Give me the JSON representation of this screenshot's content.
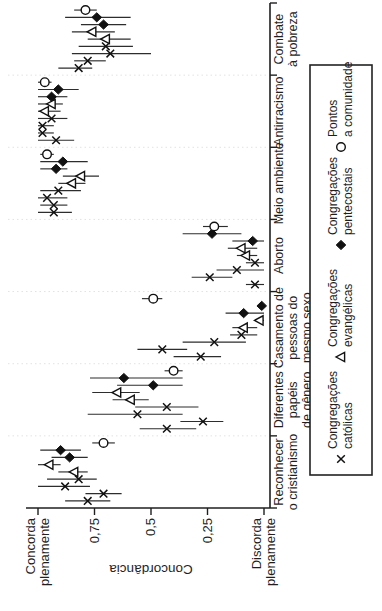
{
  "figure": {
    "background": "#ffffff",
    "ink": "#1f1f1f",
    "marker_color": "#111111",
    "errorbar_color": "#2d2d2d",
    "separator_color": "#e2e2e2"
  },
  "chart_data": {
    "type": "scatter",
    "title": "",
    "ylabel": "Concordância",
    "ylim": [
      0,
      1
    ],
    "grid": "dotted vertical separators between categories",
    "layout": {
      "rotated_90_ccw": true,
      "legend_position": "bottom"
    },
    "yticks": [
      {
        "value": 1.0,
        "lines": [
          "Concorda",
          "plenamente"
        ]
      },
      {
        "value": 0.75,
        "lines": [
          "0,75"
        ]
      },
      {
        "value": 0.5,
        "lines": [
          "0,5"
        ]
      },
      {
        "value": 0.25,
        "lines": [
          "0,25"
        ]
      },
      {
        "value": 0.0,
        "lines": [
          "Discorda",
          "plenamente"
        ]
      }
    ],
    "legend": [
      {
        "series": "congregacoes-catolicas",
        "marker": "x",
        "lines": [
          "Congregações",
          "católicas"
        ]
      },
      {
        "series": "congregacoes-evangelicas",
        "marker": "triangle-open",
        "lines": [
          "Congregações",
          "evangélicas"
        ]
      },
      {
        "series": "congregacoes-pentecostais",
        "marker": "diamond-filled",
        "lines": [
          "Congregações",
          "pentecostais"
        ]
      },
      {
        "series": "pontos-a-comunidade",
        "marker": "circle-open",
        "lines": [
          "Pontos",
          "a comunidade"
        ]
      }
    ],
    "point_format": [
      "marker",
      "value",
      "ci_low",
      "ci_high"
    ],
    "categories": [
      {
        "name": "Reconhecer o cristianismo",
        "lines": [
          "Reconhecer",
          "o cristianismo"
        ],
        "points": [
          [
            "x",
            0.78,
            0.68,
            0.88
          ],
          [
            "x",
            0.71,
            0.63,
            0.79
          ],
          [
            "x",
            0.88,
            0.77,
            1.0
          ],
          [
            "x",
            0.82,
            0.74,
            0.96
          ],
          [
            "triangle-open",
            0.84,
            0.78,
            0.91
          ],
          [
            "triangle-open",
            0.95,
            0.9,
            1.0
          ],
          [
            "diamond-filled",
            0.86,
            0.78,
            0.94
          ],
          [
            "diamond-filled",
            0.9,
            0.81,
            0.99
          ],
          [
            "circle-open",
            0.71,
            0.66,
            0.76
          ]
        ]
      },
      {
        "name": "Diferentes papéis de gênero",
        "lines": [
          "Diferentes",
          "papéis",
          "de gênero"
        ],
        "points": [
          [
            "x",
            0.43,
            0.3,
            0.55
          ],
          [
            "x",
            0.27,
            0.18,
            0.37
          ],
          [
            "x",
            0.56,
            0.36,
            0.78
          ],
          [
            "x",
            0.43,
            0.29,
            0.57
          ],
          [
            "triangle-open",
            0.59,
            0.51,
            0.67
          ],
          [
            "triangle-open",
            0.65,
            0.55,
            0.76
          ],
          [
            "diamond-filled",
            0.49,
            0.36,
            0.65
          ],
          [
            "diamond-filled",
            0.62,
            0.36,
            0.77
          ],
          [
            "circle-open",
            0.4,
            0.36,
            0.44
          ]
        ]
      },
      {
        "name": "Casamento de pessoas do mesmo sexo",
        "lines": [
          "Casamento de",
          "pessoas do",
          "mesmo sexo"
        ],
        "points": [
          [
            "x",
            0.28,
            0.19,
            0.4
          ],
          [
            "x",
            0.45,
            0.34,
            0.56
          ],
          [
            "x",
            0.22,
            0.08,
            0.36
          ],
          [
            "x",
            0.1,
            0.03,
            0.15
          ],
          [
            "triangle-open",
            0.09,
            0.03,
            0.14
          ],
          [
            "triangle-open",
            0.02,
            0.0,
            0.04
          ],
          [
            "diamond-filled",
            0.09,
            0.0,
            0.17
          ],
          [
            "diamond-filled",
            0.01,
            0.0,
            0.03
          ],
          [
            "circle-open",
            0.49,
            0.45,
            0.54
          ]
        ]
      },
      {
        "name": "Aborto",
        "lines": [
          "Aborto"
        ],
        "points": [
          [
            "x",
            0.04,
            0.0,
            0.08
          ],
          [
            "x",
            0.24,
            0.14,
            0.32
          ],
          [
            "x",
            0.12,
            0.0,
            0.21
          ],
          [
            "x",
            0.04,
            0.0,
            0.08
          ],
          [
            "triangle-open",
            0.08,
            0.03,
            0.12
          ],
          [
            "triangle-open",
            0.1,
            0.03,
            0.16
          ],
          [
            "diamond-filled",
            0.05,
            0.0,
            0.14
          ],
          [
            "diamond-filled",
            0.23,
            0.1,
            0.36
          ],
          [
            "circle-open",
            0.22,
            0.16,
            0.27
          ]
        ]
      },
      {
        "name": "Meio ambiente",
        "lines": [
          "Meio ambiente"
        ],
        "points": [
          [
            "x",
            0.93,
            0.85,
            1.0
          ],
          [
            "x",
            0.93,
            0.87,
            0.99
          ],
          [
            "x",
            0.96,
            0.87,
            1.0
          ],
          [
            "x",
            0.91,
            0.81,
            0.99
          ],
          [
            "triangle-open",
            0.85,
            0.79,
            0.91
          ],
          [
            "triangle-open",
            0.81,
            0.73,
            0.89
          ],
          [
            "diamond-filled",
            0.92,
            0.87,
            0.99
          ],
          [
            "diamond-filled",
            0.89,
            0.78,
            0.99
          ],
          [
            "circle-open",
            0.96,
            0.93,
            0.99
          ]
        ]
      },
      {
        "name": "Antirracismo",
        "lines": [
          "Antirracismo"
        ],
        "points": [
          [
            "x",
            0.92,
            0.84,
            1.0
          ],
          [
            "x",
            0.98,
            0.93,
            1.0
          ],
          [
            "x",
            0.98,
            0.93,
            1.0
          ],
          [
            "x",
            0.94,
            0.87,
            1.0
          ],
          [
            "triangle-open",
            0.97,
            0.9,
            1.0
          ],
          [
            "triangle-open",
            0.94,
            0.89,
            1.0
          ],
          [
            "diamond-filled",
            0.94,
            0.87,
            1.0
          ],
          [
            "diamond-filled",
            0.91,
            0.82,
            1.0
          ],
          [
            "circle-open",
            0.97,
            0.94,
            1.0
          ]
        ]
      },
      {
        "name": "Combate à pobreza",
        "lines": [
          "Combate",
          "à pobreza"
        ],
        "points": [
          [
            "x",
            0.82,
            0.76,
            0.91
          ],
          [
            "x",
            0.78,
            0.7,
            0.84
          ],
          [
            "x",
            0.68,
            0.5,
            0.85
          ],
          [
            "x",
            0.7,
            0.58,
            0.82
          ],
          [
            "triangle-open",
            0.7,
            0.59,
            0.78
          ],
          [
            "triangle-open",
            0.76,
            0.66,
            0.85
          ],
          [
            "diamond-filled",
            0.71,
            0.61,
            0.81
          ],
          [
            "diamond-filled",
            0.74,
            0.59,
            0.88
          ],
          [
            "circle-open",
            0.79,
            0.74,
            0.84
          ]
        ]
      }
    ]
  }
}
